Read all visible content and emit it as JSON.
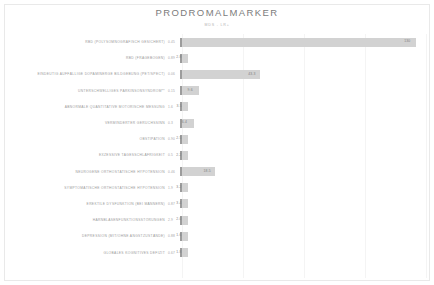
{
  "chart_title": "PRODROMALMARKER",
  "subtitle": "MDS - LR+",
  "chart_data": {
    "type": "bar",
    "orientation": "horizontal",
    "title": "PRODROMALMARKER",
    "subtitle": "MDS - LR+",
    "xlabel": "",
    "ylabel": "",
    "xlim": [
      0,
      140
    ],
    "grid": true,
    "legend": "none",
    "categories": [
      "RBD (POLYSOMNOGRAFISCH GESICHERT)",
      "RBD (FRAGEBOGEN)",
      "EINDEUTIG AUFFÄLLIGE DOPAMINERGE BILDGEBUNG (PET/SPECT)",
      "UNTERSCHWELLIGES PARKINSONSYNDROM**",
      "ABNORMALE QUANTITATIVE MOTORISCHE MESSUNG",
      "VERMINDERTER GERUCHSSINN",
      "OBSTIPATION",
      "EXZESSIVE TAGESSCHLÄFRIGKEIT",
      "NEUROGENE ORTHOSTATISCHE HYPOTENSION",
      "SYMPTOMATISCHE ORTHOSTATISCHE HYPOTENSION",
      "EREKTILE DYSFUNKTION (BEI MÄNNERN)",
      "HARNBLASENFUNKTIONSSTÖRUNGEN",
      "DEPRESSION (MIT/OHNE ANGSTZUSTÄNDE)",
      "GLOBALES KOGNITIVES DEFIZIT"
    ],
    "values": [
      130,
      2.8,
      43.3,
      9.6,
      3.5,
      6.4,
      2.5,
      2.2,
      18.5,
      3.2,
      3.4,
      2.0,
      1.6,
      1.8
    ],
    "start_values": [
      "0.45",
      "0.89",
      "0.06",
      "0.15",
      "1.6",
      "0.3",
      "0.90",
      "0.5",
      "0.46",
      "1.9",
      "0.87",
      "2.9",
      "0.88",
      "0.67"
    ],
    "end_labels": [
      "130",
      "2.8",
      "43.3",
      "9.6",
      "3.5",
      "6.4",
      "2.5",
      "2.2",
      "18.5",
      "3.2",
      "3.4",
      "2.0",
      "1.6",
      "1.8"
    ]
  },
  "rows": [
    {
      "label": "RBD (POLYSOMNOGRAFISCH GESICHERT)",
      "start": "0.45",
      "value": 130,
      "end": "130"
    },
    {
      "label": "RBD (FRAGEBOGEN)",
      "start": "0.89",
      "value": 2.8,
      "end": "2.8"
    },
    {
      "label": "EINDEUTIG AUFFÄLLIGE DOPAMINERGE BILDGEBUNG (PET/SPECT)",
      "start": "0.06",
      "value": 43.3,
      "end": "43.3"
    },
    {
      "label": "UNTERSCHWELLIGES PARKINSONSYNDROM**",
      "start": "0.15",
      "value": 9.6,
      "end": "9.6"
    },
    {
      "label": "ABNORMALE QUANTITATIVE MOTORISCHE MESSUNG",
      "start": "1.6",
      "value": 3.5,
      "end": "3.5"
    },
    {
      "label": "VERMINDERTER GERUCHSSINN",
      "start": "0.3",
      "value": 6.4,
      "end": "6.4"
    },
    {
      "label": "OBSTIPATION",
      "start": "0.90",
      "value": 2.5,
      "end": "2.5"
    },
    {
      "label": "EXZESSIVE TAGESSCHLÄFRIGKEIT",
      "start": "0.5",
      "value": 2.2,
      "end": "2.2"
    },
    {
      "label": "NEUROGENE ORTHOSTATISCHE HYPOTENSION",
      "start": "0.46",
      "value": 18.5,
      "end": "18.5"
    },
    {
      "label": "SYMPTOMATISCHE ORTHOSTATISCHE HYPOTENSION",
      "start": "1.9",
      "value": 3.2,
      "end": "3.2"
    },
    {
      "label": "EREKTILE DYSFUNKTION (BEI MÄNNERN)",
      "start": "0.87",
      "value": 3.4,
      "end": "3.4"
    },
    {
      "label": "HARNBLASENFUNKTIONSSTÖRUNGEN",
      "start": "2.9",
      "value": 2.0,
      "end": "2.0"
    },
    {
      "label": "DEPRESSION (MIT/OHNE ANGSTZUSTÄNDE)",
      "start": "0.88",
      "value": 1.6,
      "end": "1.6"
    },
    {
      "label": "GLOBALES KOGNITIVES DEFIZIT",
      "start": "0.67",
      "value": 1.8,
      "end": "1.8"
    }
  ],
  "colors": {
    "bar_fill": "#d2d2d2",
    "bar_cap": "#9c9c9c",
    "text": "#9b9b9b",
    "title": "#7c7c7c",
    "grid": "#f4f4f4",
    "background": "#ffffff"
  }
}
